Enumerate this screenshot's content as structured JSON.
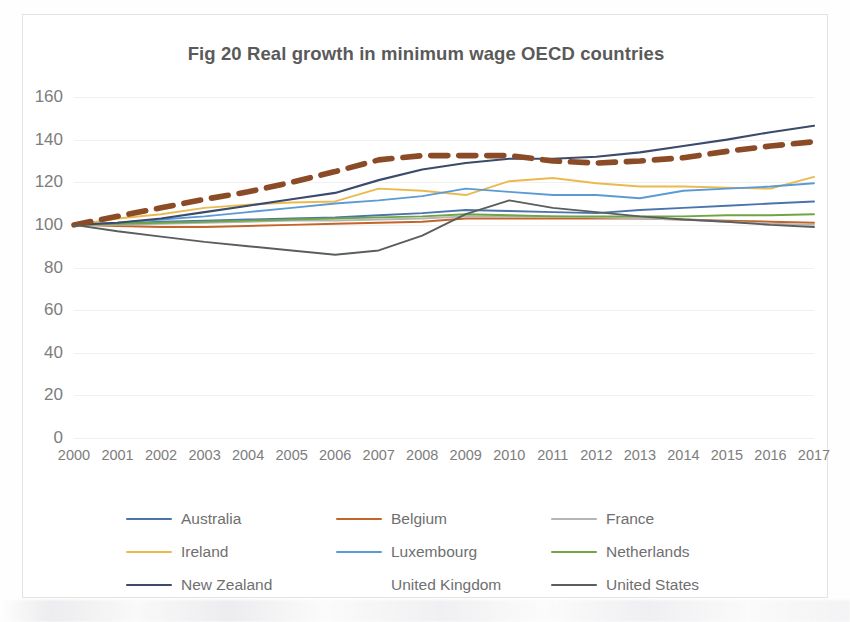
{
  "chart_data": {
    "type": "line",
    "title": "Fig 20  Real growth in minimum wage OECD countries",
    "xlabel": "",
    "ylabel": "",
    "ylim": [
      0,
      160
    ],
    "ytick_step": 20,
    "yticks": [
      "160",
      "140",
      "120",
      "100",
      "80",
      "60",
      "40",
      "20",
      "0"
    ],
    "grid": true,
    "legend_position": "bottom",
    "legend_columns": 3,
    "x": [
      "2000",
      "2001",
      "2002",
      "2003",
      "2004",
      "2005",
      "2006",
      "2007",
      "2008",
      "2009",
      "2010",
      "2011",
      "2012",
      "2013",
      "2014",
      "2015",
      "2016",
      "2017"
    ],
    "series": [
      {
        "name": "Australia",
        "color": "#4a74ab",
        "style": "solid",
        "width": 1.9,
        "values": [
          100,
          100.5,
          101.5,
          102,
          102.5,
          103,
          103.5,
          104.5,
          105.5,
          107,
          106.5,
          106,
          105.5,
          107,
          108,
          109,
          110,
          111
        ]
      },
      {
        "name": "Belgium",
        "color": "#c3642a",
        "style": "solid",
        "width": 1.9,
        "values": [
          100,
          99.5,
          99,
          99,
          99.5,
          100,
          100.5,
          101,
          101.5,
          103,
          103,
          103,
          103,
          103,
          102.5,
          102,
          101.5,
          101
        ]
      },
      {
        "name": "France",
        "color": "#b5b5b5",
        "style": "solid",
        "width": 1.9,
        "values": [
          100,
          100,
          100.5,
          101,
          101.5,
          102,
          102,
          102.5,
          103,
          104,
          104,
          104,
          103.5,
          103,
          102.5,
          101.5,
          100.5,
          100
        ]
      },
      {
        "name": "Ireland",
        "color": "#ecb94f",
        "style": "solid",
        "width": 1.9,
        "values": [
          100,
          103,
          105,
          108,
          109.5,
          110.5,
          111,
          117,
          116,
          114,
          120.5,
          122,
          119.5,
          118,
          118,
          117.5,
          117,
          122.5
        ]
      },
      {
        "name": "Luxembourg",
        "color": "#5b9bd5",
        "style": "solid",
        "width": 1.9,
        "values": [
          100,
          101,
          102.5,
          104,
          106,
          108,
          110,
          111.5,
          113.5,
          117,
          115.5,
          114,
          114,
          112.5,
          116,
          117,
          118,
          119.5
        ]
      },
      {
        "name": "Netherlands",
        "color": "#6fa544",
        "style": "solid",
        "width": 1.9,
        "values": [
          100,
          100.5,
          101,
          101.5,
          102,
          102.5,
          103,
          103.5,
          104,
          105,
          104.5,
          104,
          104,
          104,
          104,
          104.5,
          104.5,
          105
        ]
      },
      {
        "name": "New Zealand",
        "color": "#3b4b6b",
        "style": "solid",
        "width": 2.1,
        "values": [
          100,
          101,
          103,
          106,
          109,
          112,
          115,
          121,
          126,
          129,
          131,
          131,
          132,
          134,
          137,
          140,
          143.5,
          146.5
        ]
      },
      {
        "name": "United Kingdom",
        "color": "#8a4b26",
        "style": "dashed",
        "width": 5.6,
        "values": [
          100,
          104,
          108,
          112,
          115.5,
          120,
          125,
          130.5,
          132.5,
          132.5,
          132.5,
          130,
          129,
          130,
          131.5,
          134.5,
          137,
          139
        ]
      },
      {
        "name": "United States",
        "color": "#595f5c",
        "style": "solid",
        "width": 1.9,
        "values": [
          100,
          97,
          94.5,
          92,
          90,
          88,
          86,
          88,
          95,
          105,
          111.5,
          108,
          106,
          104,
          102.5,
          101.5,
          100,
          99
        ]
      }
    ]
  },
  "legend": {
    "rows": [
      [
        {
          "label": "Australia",
          "series_index": 0
        },
        {
          "label": "Belgium",
          "series_index": 1
        },
        {
          "label": "France",
          "series_index": 2
        }
      ],
      [
        {
          "label": "Ireland",
          "series_index": 3
        },
        {
          "label": "Luxembourg",
          "series_index": 4
        },
        {
          "label": "Netherlands",
          "series_index": 5
        }
      ],
      [
        {
          "label": "New Zealand",
          "series_index": 6
        },
        {
          "label": "United Kingdom",
          "series_index": 7
        },
        {
          "label": "United States",
          "series_index": 8
        }
      ]
    ]
  },
  "colors": {
    "title_text": "#5a5a5a",
    "tick_text": "#7d7d7d",
    "legend_text": "#6f6f6f",
    "gridline": "#f0f0f0",
    "card_border": "#e3e3e3",
    "background": "#ffffff"
  }
}
